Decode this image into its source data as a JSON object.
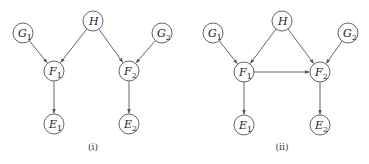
{
  "diagrams": [
    {
      "caption": "(i)",
      "caption_pos": [
        93,
        150
      ],
      "nodes": [
        {
          "id": "H",
          "letter": "H",
          "sub": "",
          "x": 93,
          "y": 21
        },
        {
          "id": "G1",
          "letter": "G",
          "sub": "1",
          "x": 23,
          "y": 33
        },
        {
          "id": "G2",
          "letter": "G",
          "sub": "2",
          "x": 162,
          "y": 33
        },
        {
          "id": "F1",
          "letter": "F",
          "sub": "1",
          "x": 54,
          "y": 71
        },
        {
          "id": "F2",
          "letter": "F",
          "sub": "2",
          "x": 129,
          "y": 71
        },
        {
          "id": "E1",
          "letter": "E",
          "sub": "1",
          "x": 54,
          "y": 124
        },
        {
          "id": "E2",
          "letter": "E",
          "sub": "2",
          "x": 129,
          "y": 124
        }
      ],
      "edges": [
        [
          "G1",
          "F1"
        ],
        [
          "H",
          "F1"
        ],
        [
          "H",
          "F2"
        ],
        [
          "G2",
          "F2"
        ],
        [
          "F1",
          "E1"
        ],
        [
          "F2",
          "E2"
        ]
      ]
    },
    {
      "caption": "(ii)",
      "caption_pos": [
        282,
        150
      ],
      "nodes": [
        {
          "id": "H",
          "letter": "H",
          "sub": "",
          "x": 282,
          "y": 21
        },
        {
          "id": "G1",
          "letter": "G",
          "sub": "1",
          "x": 213,
          "y": 33
        },
        {
          "id": "G2",
          "letter": "G",
          "sub": "2",
          "x": 348,
          "y": 33
        },
        {
          "id": "F1",
          "letter": "F",
          "sub": "1",
          "x": 244,
          "y": 72
        },
        {
          "id": "F2",
          "letter": "F",
          "sub": "2",
          "x": 320,
          "y": 72
        },
        {
          "id": "E1",
          "letter": "E",
          "sub": "1",
          "x": 244,
          "y": 125
        },
        {
          "id": "E2",
          "letter": "E",
          "sub": "2",
          "x": 320,
          "y": 125
        }
      ],
      "edges": [
        [
          "G1",
          "F1"
        ],
        [
          "H",
          "F1"
        ],
        [
          "H",
          "F2"
        ],
        [
          "G2",
          "F2"
        ],
        [
          "F1",
          "F2"
        ],
        [
          "F1",
          "E1"
        ],
        [
          "F2",
          "E2"
        ]
      ]
    }
  ],
  "node_radius": 10,
  "colors": {
    "stroke": "#555555",
    "text": "#222222",
    "background": "#ffffff"
  }
}
